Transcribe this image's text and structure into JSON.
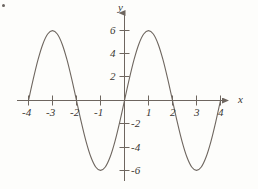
{
  "chart_data": {
    "type": "line",
    "title": "",
    "subtitle": "",
    "xlabel": "x",
    "ylabel": "y",
    "xlim": [
      -4.45,
      4.6
    ],
    "ylim": [
      -7.4,
      7.2
    ],
    "grid": false,
    "legend": null,
    "function": "y = 6 sin(pi x / 2)",
    "amplitude": 6,
    "period": 4,
    "x_ticks": [
      -4,
      -3,
      -2,
      -1,
      1,
      2,
      3,
      4
    ],
    "x_tick_labels": [
      "-4",
      "-3",
      "-2",
      "-1",
      "1",
      "2",
      "3",
      "4"
    ],
    "y_ticks": [
      6,
      4,
      2,
      -2,
      -4,
      -6
    ],
    "y_tick_labels": [
      "6",
      "4",
      "2",
      "-2",
      "-4",
      "-6"
    ],
    "x_domain": [
      -4,
      4
    ],
    "x": [
      -4.0,
      -3.8,
      -3.6,
      -3.4,
      -3.2,
      -3.0,
      -2.8,
      -2.6,
      -2.4,
      -2.2,
      -2.0,
      -1.8,
      -1.6,
      -1.4,
      -1.2,
      -1.0,
      -0.8,
      -0.6,
      -0.4,
      -0.2,
      0.0,
      0.2,
      0.4,
      0.6,
      0.8,
      1.0,
      1.2,
      1.4,
      1.6,
      1.8,
      2.0,
      2.2,
      2.4,
      2.6,
      2.8,
      3.0,
      3.2,
      3.4,
      3.6,
      3.8,
      4.0
    ],
    "y": [
      0.0,
      1.854,
      3.527,
      4.854,
      5.706,
      6.0,
      5.706,
      4.854,
      3.527,
      1.854,
      0.0,
      -1.854,
      -3.527,
      -4.854,
      -5.706,
      -6.0,
      -5.706,
      -4.854,
      -3.527,
      -1.854,
      0.0,
      1.854,
      3.527,
      4.854,
      5.706,
      6.0,
      5.706,
      4.854,
      3.527,
      1.854,
      0.0,
      -1.854,
      -3.527,
      -4.854,
      -5.706,
      -6.0,
      -5.706,
      -4.854,
      -3.527,
      -1.854,
      0.0
    ],
    "maxima": [
      {
        "x": -3,
        "y": 6
      },
      {
        "x": 1,
        "y": 6
      }
    ],
    "minima": [
      {
        "x": -1,
        "y": -6
      },
      {
        "x": 3,
        "y": -6
      }
    ],
    "zero_crossings": [
      -4,
      -2,
      0,
      2,
      4
    ],
    "colors": {
      "curve": "#6e665f",
      "axis": "#6e665f",
      "text": "#3a3632",
      "background": "#fdfdfb"
    }
  },
  "axes": {
    "x_axis_name": "x",
    "y_axis_name": "y"
  }
}
